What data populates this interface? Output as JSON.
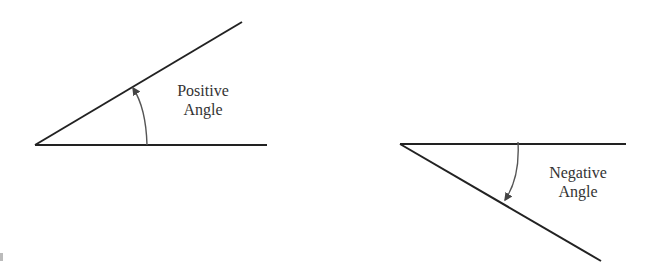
{
  "diagrams": [
    {
      "id": "positive",
      "label_line1": "Positive",
      "label_line2": "Angle",
      "direction": "counterclockwise"
    },
    {
      "id": "negative",
      "label_line1": "Negative",
      "label_line2": "Angle",
      "direction": "clockwise"
    }
  ],
  "colors": {
    "stroke": "#222222",
    "arc": "#555555",
    "text": "#333333"
  }
}
